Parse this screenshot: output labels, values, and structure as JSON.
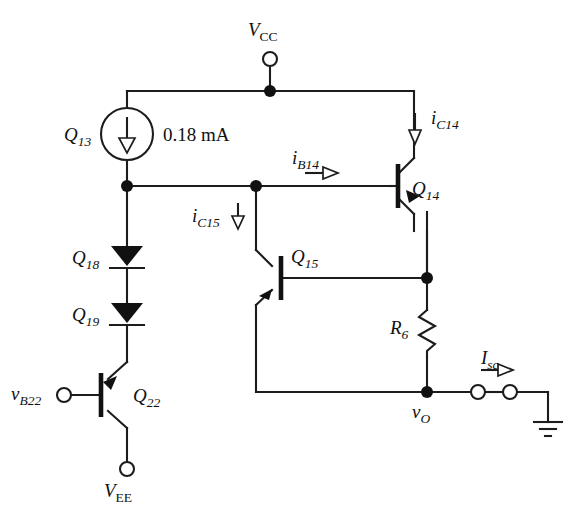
{
  "figure": {
    "type": "circuit-schematic",
    "background_color": "#ffffff",
    "line_color": "#1c1c1c"
  },
  "supplies": {
    "vcc": {
      "symbol": "V",
      "subscript": "CC",
      "terminal": "open-circle"
    },
    "vee": {
      "symbol": "V",
      "subscript": "EE",
      "terminal": "open-circle"
    },
    "ground": {
      "label": "",
      "symbol": "earth-ground"
    }
  },
  "sources": {
    "q13": {
      "device_label": "Q",
      "device_subscript": "13",
      "value": "0.18 mA",
      "kind": "current-source",
      "direction": "down"
    }
  },
  "transistors": [
    {
      "id": "q14",
      "label": "Q",
      "subscript": "14",
      "type": "npn",
      "orientation": "base-left"
    },
    {
      "id": "q15",
      "label": "Q",
      "subscript": "15",
      "type": "npn",
      "orientation": "base-right"
    },
    {
      "id": "q22",
      "label": "Q",
      "subscript": "22",
      "type": "pnp",
      "orientation": "base-left"
    }
  ],
  "diodes": [
    {
      "id": "q18",
      "label": "Q",
      "subscript": "18",
      "direction": "down"
    },
    {
      "id": "q19",
      "label": "Q",
      "subscript": "19",
      "direction": "down"
    }
  ],
  "resistors": [
    {
      "id": "r6",
      "label": "R",
      "subscript": "6",
      "orientation": "vertical"
    }
  ],
  "currents": [
    {
      "id": "ic14",
      "label": "i",
      "subscript": "C14",
      "arrow": "down",
      "style": "hollow"
    },
    {
      "id": "ib14",
      "label": "i",
      "subscript": "B14",
      "arrow": "right",
      "style": "hollow"
    },
    {
      "id": "ic15",
      "label": "i",
      "subscript": "C15",
      "arrow": "down",
      "style": "hollow"
    },
    {
      "id": "isc",
      "label": "I",
      "subscript": "sc",
      "arrow": "right",
      "style": "hollow"
    }
  ],
  "nodes": [
    {
      "id": "vo",
      "label": "v",
      "subscript": "O"
    },
    {
      "id": "vb22",
      "label": "v",
      "subscript": "B22",
      "terminal": "open-circle"
    }
  ],
  "terminals": {
    "short_circuit_pair": {
      "count": 2,
      "style": "open-circle"
    }
  }
}
